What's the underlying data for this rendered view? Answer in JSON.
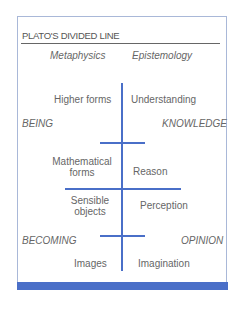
{
  "title": "PLATO'S DIVIDED LINE",
  "headers": {
    "left": "Metaphysics",
    "right": "Epistemology"
  },
  "realms": {
    "upper_left": "BEING",
    "upper_right": "KNOWLEDGE",
    "lower_left": "BECOMING",
    "lower_right": "OPINION"
  },
  "segments": [
    {
      "object": "Higher forms",
      "faculty": "Understanding"
    },
    {
      "object": "Mathematical forms",
      "object_lines": [
        "Mathematical",
        "forms"
      ],
      "faculty": "Reason"
    },
    {
      "object": "Sensible objects",
      "object_lines": [
        "Sensible",
        "objects"
      ],
      "faculty": "Perception"
    },
    {
      "object": "Images",
      "faculty": "Imagination"
    }
  ],
  "colors": {
    "line": "#4a6fc8",
    "border": "#a9b8d8",
    "text": "#666666"
  }
}
